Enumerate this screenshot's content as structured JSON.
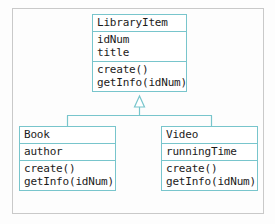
{
  "diagram": {
    "type": "uml-class-diagram",
    "colors": {
      "border": "#78c5cc",
      "frame": "#c9c9c9",
      "text": "#1b1b1b",
      "background": "#fdfdfd",
      "box_fill": "#ffffff"
    },
    "classes": {
      "parent": {
        "name": "LibraryItem",
        "attributes": [
          "idNum",
          "title"
        ],
        "methods": [
          "create()",
          "getInfo(idNum)"
        ]
      },
      "child_left": {
        "name": "Book",
        "attributes": [
          "author"
        ],
        "methods": [
          "create()",
          "getInfo(idNum)"
        ]
      },
      "child_right": {
        "name": "Video",
        "attributes": [
          "runningTime"
        ],
        "methods": [
          "create()",
          "getInfo(idNum)"
        ]
      }
    },
    "relationship": {
      "kind": "generalization",
      "label": "inheritance-triangle",
      "from": [
        "Book",
        "Video"
      ],
      "to": "LibraryItem"
    }
  }
}
